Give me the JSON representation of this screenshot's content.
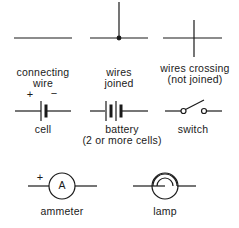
{
  "colors": {
    "stroke": "#1a1a1a",
    "background": "#ffffff"
  },
  "symbols": [
    {
      "id": "connecting-wire",
      "label_line1": "connecting",
      "label_line2": "wire"
    },
    {
      "id": "wires-joined",
      "label_line1": "wires",
      "label_line2": "joined"
    },
    {
      "id": "wires-crossing",
      "label_line1": "wires crossing",
      "label_line2": "(not joined)"
    },
    {
      "id": "cell",
      "label_line1": "cell",
      "plus": "+",
      "minus": "−"
    },
    {
      "id": "battery",
      "label_line1": "battery",
      "label_line2": "(2 or more cells)"
    },
    {
      "id": "switch",
      "label_line1": "switch"
    },
    {
      "id": "ammeter",
      "label_line1": "ammeter",
      "plus": "+",
      "glyph": "A"
    },
    {
      "id": "lamp",
      "label_line1": "lamp"
    }
  ]
}
